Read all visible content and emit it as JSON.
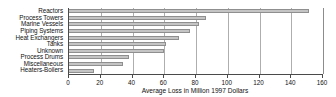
{
  "chart_data": {
    "type": "bar",
    "orientation": "horizontal",
    "title": "",
    "xlabel": "Average Loss in Million 1997 Dollars",
    "ylabel": "",
    "xlim": [
      0,
      160
    ],
    "xticks": [
      0,
      20,
      40,
      60,
      80,
      100,
      120,
      140,
      160
    ],
    "xtick_labels": [
      "0",
      "20",
      "40",
      "60",
      "80",
      "100",
      "120",
      "140",
      "160"
    ],
    "grid": true,
    "grid_axis": "x",
    "legend": false,
    "categories": [
      "Reactors",
      "Process Towers",
      "Marine Vessels",
      "Piping Systems",
      "Heat Exchangers",
      "Tanks",
      "Unknown",
      "Process Drums",
      "Miscellaneous",
      "Heaters-Boilers"
    ],
    "values": [
      151,
      86,
      82,
      76,
      69,
      61,
      60,
      38,
      34,
      16
    ],
    "bar_color": "#c4c4c4",
    "bar_edge_color": "#8f8f8f",
    "axis_color": "#4a4a4a",
    "gridline_color": "#aeaeae",
    "background_color": "#ffffff"
  }
}
